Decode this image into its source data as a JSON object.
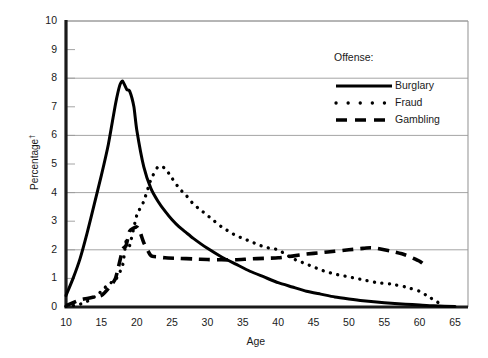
{
  "chart_data": {
    "type": "line",
    "title": "",
    "xlabel": "Age",
    "ylabel": "Percentage†",
    "xlim": [
      10,
      65
    ],
    "ylim": [
      0,
      10
    ],
    "xticks": [
      10,
      15,
      20,
      25,
      30,
      35,
      40,
      45,
      50,
      55,
      60,
      65
    ],
    "yticks": [
      0,
      1,
      2,
      3,
      4,
      5,
      6,
      7,
      8,
      9,
      10
    ],
    "gridlines_y": [
      0,
      2,
      4,
      6,
      8,
      10
    ],
    "grid": "horizontal-even-only",
    "legend_title": "Offense:",
    "legend_position": "upper-right-inside",
    "series": [
      {
        "name": "Burglary",
        "style": "solid",
        "color": "#000000",
        "x": [
          10,
          11,
          12,
          13,
          14,
          15,
          16,
          17,
          17.6,
          18,
          18.6,
          19,
          19.6,
          20,
          21,
          22,
          23,
          24,
          25,
          26,
          27,
          28,
          30,
          32,
          34,
          36,
          38,
          40,
          42,
          44,
          46,
          48,
          50,
          52,
          55,
          58,
          60,
          62,
          65
        ],
        "values": [
          0.4,
          1.0,
          1.7,
          2.6,
          3.6,
          4.6,
          5.7,
          7.1,
          7.75,
          7.9,
          7.6,
          7.55,
          7.0,
          6.2,
          4.9,
          4.15,
          3.7,
          3.35,
          3.05,
          2.8,
          2.6,
          2.4,
          2.05,
          1.75,
          1.5,
          1.25,
          1.05,
          0.85,
          0.7,
          0.55,
          0.45,
          0.35,
          0.28,
          0.22,
          0.15,
          0.1,
          0.07,
          0.04,
          0.02
        ]
      },
      {
        "name": "Fraud",
        "style": "dotted",
        "color": "#000000",
        "x": [
          10,
          11,
          12,
          13,
          14,
          15,
          16,
          17,
          18,
          18.5,
          19,
          20,
          21,
          22,
          23,
          24,
          25,
          26,
          27,
          28,
          29,
          30,
          31,
          32,
          33,
          34,
          35,
          36,
          37,
          38,
          39,
          40,
          41,
          42,
          43,
          44,
          45,
          46,
          47,
          48,
          49,
          50,
          51,
          52,
          54,
          56,
          58,
          60,
          61,
          62,
          63
        ],
        "values": [
          0.02,
          0.05,
          0.1,
          0.2,
          0.35,
          0.55,
          0.8,
          0.95,
          1.45,
          2.3,
          2.15,
          3.2,
          3.7,
          4.45,
          4.9,
          4.85,
          4.5,
          4.15,
          3.9,
          3.6,
          3.4,
          3.2,
          3.0,
          2.8,
          2.65,
          2.5,
          2.4,
          2.3,
          2.2,
          2.1,
          2.05,
          2.0,
          1.85,
          1.7,
          1.6,
          1.5,
          1.4,
          1.3,
          1.22,
          1.15,
          1.1,
          1.05,
          1.0,
          0.95,
          0.85,
          0.8,
          0.7,
          0.55,
          0.4,
          0.25,
          0.1
        ]
      },
      {
        "name": "Gambling",
        "style": "dashed",
        "color": "#000000",
        "x": [
          10,
          11,
          12,
          13,
          14,
          15,
          16,
          17,
          18,
          18.5,
          19,
          20,
          20.5,
          21,
          22,
          23,
          24,
          26,
          28,
          30,
          32,
          34,
          36,
          38,
          40,
          42,
          44,
          46,
          48,
          50,
          52,
          53,
          54,
          56,
          58,
          60,
          61
        ],
        "values": [
          0.05,
          0.15,
          0.25,
          0.3,
          0.35,
          0.4,
          0.65,
          1.0,
          2.0,
          2.15,
          2.65,
          2.8,
          2.6,
          2.25,
          1.8,
          1.75,
          1.72,
          1.7,
          1.68,
          1.66,
          1.65,
          1.65,
          1.68,
          1.7,
          1.72,
          1.78,
          1.85,
          1.9,
          1.95,
          2.0,
          2.05,
          2.07,
          2.05,
          1.95,
          1.82,
          1.6,
          1.4
        ]
      }
    ]
  },
  "axes": {
    "x_axis_label": "Age",
    "y_axis_label_prefix": "Percentage",
    "y_axis_label_marker": "†"
  },
  "legend": {
    "title": "Offense:",
    "entries": [
      {
        "label": "Burglary",
        "style": "solid"
      },
      {
        "label": "Fraud",
        "style": "dotted"
      },
      {
        "label": "Gambling",
        "style": "dashed"
      }
    ]
  },
  "colors": {
    "line": "#000000",
    "grid": "#9a9a9a",
    "axis": "#1a1a1a",
    "background": "#ffffff"
  }
}
